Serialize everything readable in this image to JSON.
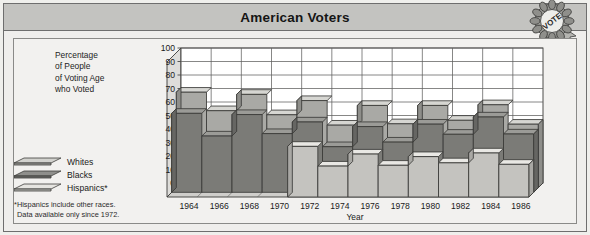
{
  "header": {
    "title": "American Voters",
    "badge_icon": "vote-rosette-icon",
    "badge_text": "VOTE"
  },
  "axis_caption": {
    "lines": [
      "Percentage",
      "of People",
      "of Voting Age",
      "who Voted"
    ],
    "full": "Percentage of People of Voting Age who Voted"
  },
  "legend": {
    "items": [
      {
        "label": "Whites",
        "swatch_icon": "slab-swatch-icon",
        "color": "#cfcfcb"
      },
      {
        "label": "Blacks",
        "swatch_icon": "slab-swatch-icon",
        "color": "#8f8f8c"
      },
      {
        "label": "Hispanics*",
        "swatch_icon": "slab-swatch-icon",
        "color": "#e3e2de"
      }
    ]
  },
  "footnote": {
    "line1": "*Hispanics include other races.",
    "line2": "Data available only since 1972."
  },
  "chart_data": {
    "type": "area",
    "title": "American Voters",
    "xlabel": "Year",
    "ylabel": "Percentage of People of Voting Age who Voted",
    "ylim": [
      0,
      100
    ],
    "ytick_step": 10,
    "yticks": [
      0,
      10,
      20,
      30,
      40,
      50,
      60,
      70,
      80,
      90,
      100
    ],
    "grid": true,
    "legend_position": "left",
    "style": "3d-stepped-ribbon",
    "categories": [
      "1964",
      "1966",
      "1968",
      "1970",
      "1972",
      "1974",
      "1976",
      "1978",
      "1980",
      "1982",
      "1984",
      "1986"
    ],
    "series": [
      {
        "name": "Whites",
        "values": [
          70.7,
          57.0,
          69.1,
          54.0,
          64.5,
          46.3,
          60.9,
          47.3,
          60.9,
          49.9,
          61.4,
          47.0
        ]
      },
      {
        "name": "Blacks",
        "values": [
          58.5,
          41.7,
          57.6,
          43.5,
          52.1,
          33.8,
          48.7,
          37.2,
          50.5,
          43.0,
          55.8,
          43.2
        ]
      },
      {
        "name": "Hispanics*",
        "values": [
          null,
          null,
          null,
          null,
          37.5,
          22.9,
          31.8,
          23.5,
          29.9,
          25.3,
          32.6,
          24.2
        ]
      }
    ],
    "notes": "Hispanics include other races. Data available only since 1972."
  }
}
